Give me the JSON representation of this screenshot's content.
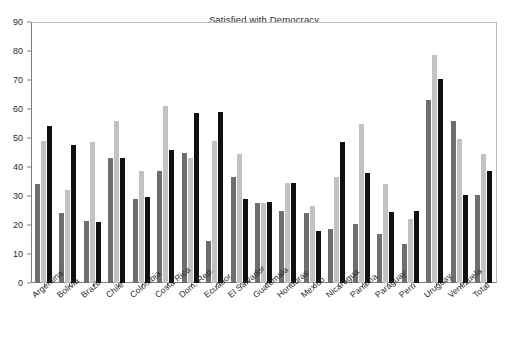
{
  "chart_data": {
    "type": "bar",
    "title": "Satisfied with Democracy",
    "xlabel": "",
    "ylabel": "",
    "ylim": [
      0,
      90
    ],
    "ytick_step": 10,
    "yticks": [
      0,
      10,
      20,
      30,
      40,
      50,
      60,
      70,
      80,
      90
    ],
    "grid": false,
    "legend": "none",
    "orientation": "vertical",
    "grouped": true,
    "categories": [
      "Argentina",
      "Bolivia",
      "Brazil",
      "Chile",
      "Colombia",
      "Costa Rica",
      "Dom. Rep.",
      "Ecuador",
      "El Salvador",
      "Guatemala",
      "Honduras",
      "Mexico",
      "Nicaragua",
      "Panama",
      "Paraguay",
      "Peru",
      "Uruguay",
      "Venezuela",
      "Total"
    ],
    "series": [
      {
        "name": "series-1",
        "color": "#6e6e6e",
        "values": [
          34,
          24,
          21.5,
          43,
          29,
          38.5,
          45,
          14.5,
          36.5,
          27.5,
          25,
          24,
          18.5,
          20.5,
          17,
          13.5,
          63,
          56,
          30.5
        ]
      },
      {
        "name": "series-2",
        "color": "#c2c2c2",
        "values": [
          49,
          32,
          48.5,
          56,
          38.5,
          61,
          43,
          49,
          44.5,
          27.5,
          34.5,
          26.5,
          36.5,
          55,
          34,
          22,
          78.5,
          49.5,
          44.5
        ]
      },
      {
        "name": "series-3",
        "color": "#101010",
        "values": [
          54,
          47.5,
          21,
          43,
          29.5,
          46,
          58.5,
          59,
          29,
          28,
          34.5,
          18,
          48.5,
          38,
          24.5,
          25,
          70.5,
          30.5,
          38.5
        ]
      }
    ]
  }
}
